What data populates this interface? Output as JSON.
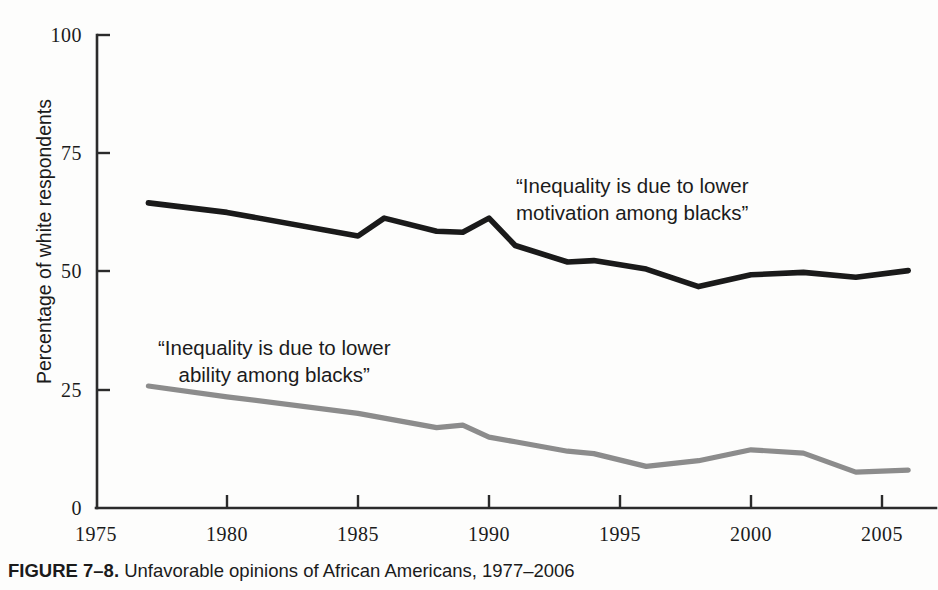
{
  "caption": {
    "label": "FIGURE 7–8.",
    "text": " Unfavorable opinions of African Americans, 1977–2006"
  },
  "axes": {
    "ylabel": "Percentage of white respondents",
    "yticks": [
      "0",
      "25",
      "50",
      "75",
      "100"
    ],
    "xticks": [
      "1975",
      "1980",
      "1985",
      "1990",
      "1995",
      "2000",
      "2005"
    ]
  },
  "annotations": {
    "motivation_line1": "“Inequality is due to lower",
    "motivation_line2": "motivation among blacks”",
    "ability_line1": "“Inequality is due to lower",
    "ability_line2": "ability among blacks”"
  },
  "colors": {
    "motivation": "#1a1a1a",
    "ability": "#8c8c8c",
    "axis": "#2b2b2b",
    "background": "#fdfdfc"
  },
  "chart_data": {
    "type": "line",
    "title": "Unfavorable opinions of African Americans, 1977–2006",
    "xlabel": "",
    "ylabel": "Percentage of white respondents",
    "xlim": [
      1975,
      2006.5
    ],
    "ylim": [
      0,
      100
    ],
    "grid": false,
    "legend": "annotations on plot",
    "x": [
      1977,
      1980,
      1985,
      1986,
      1988,
      1989,
      1990,
      1991,
      1993,
      1994,
      1996,
      1998,
      2000,
      2002,
      2004,
      2006
    ],
    "series": [
      {
        "name": "“Inequality is due to lower motivation among blacks”",
        "color": "#1a1a1a",
        "values": [
          64.5,
          62.5,
          57.5,
          61.3,
          58.5,
          58.3,
          61.3,
          55.5,
          52.0,
          52.3,
          50.5,
          46.8,
          49.3,
          49.8,
          48.8,
          50.2
        ]
      },
      {
        "name": "“Inequality is due to lower ability among blacks”",
        "color": "#8c8c8c",
        "values": [
          25.8,
          23.5,
          20.0,
          19.0,
          17.0,
          17.5,
          15.0,
          14.0,
          12.0,
          11.5,
          8.8,
          10.0,
          12.3,
          11.6,
          7.6,
          8.0
        ]
      }
    ]
  }
}
